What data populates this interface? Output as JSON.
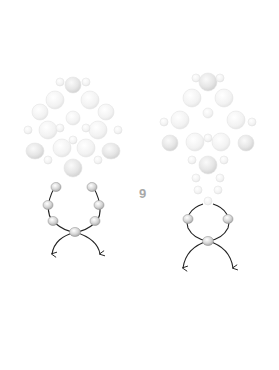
{
  "diagram": {
    "step_number": "9",
    "colors": {
      "thread": "#222222",
      "bead_highlight": "#ffffff",
      "bead_mid": "#d6d6d6",
      "bead_dark": "#a9a9a9",
      "faded_bead": "#efefef",
      "faded_stroke": "#e0e0e0",
      "label": "#a8a8a8"
    },
    "figures": [
      {
        "id": "left",
        "description": "Beaded cluster with thread loop of 7 beads, two thread ends with arrows"
      },
      {
        "id": "right",
        "description": "Beaded cluster with stacked beads and thread loop of 3 beads, two crossing thread ends with arrows"
      }
    ]
  }
}
